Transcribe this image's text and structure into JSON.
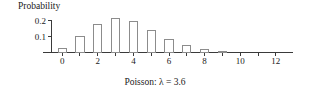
{
  "chart_data": {
    "type": "bar",
    "title": "",
    "caption": "Poisson: λ = 3.6",
    "ylabel": "Probability",
    "xlabel": "x",
    "categories": [
      0,
      1,
      2,
      3,
      4,
      5,
      6,
      7,
      8,
      9,
      10,
      11,
      12
    ],
    "values": [
      0.027,
      0.098,
      0.177,
      0.212,
      0.191,
      0.138,
      0.083,
      0.042,
      0.019,
      0.008,
      0.003,
      0.001,
      0.0
    ],
    "xlim": [
      -0.6,
      12.6
    ],
    "ylim": [
      0,
      0.24
    ],
    "x_ticks": [
      0,
      1,
      2,
      3,
      4,
      5,
      6,
      7,
      8,
      9,
      10,
      11,
      12
    ],
    "x_tick_labels": [
      "0",
      "",
      "2",
      "",
      "4",
      "",
      "6",
      "",
      "8",
      "",
      "10",
      "",
      "12"
    ],
    "y_ticks": [
      0.1,
      0.2
    ],
    "y_tick_labels": [
      "0.1",
      "0.2"
    ],
    "grid": false,
    "legend": "none",
    "bar_fill": "#ffffff",
    "bar_stroke": "#8c8c8c",
    "axis_color": "#3a3a3a"
  }
}
